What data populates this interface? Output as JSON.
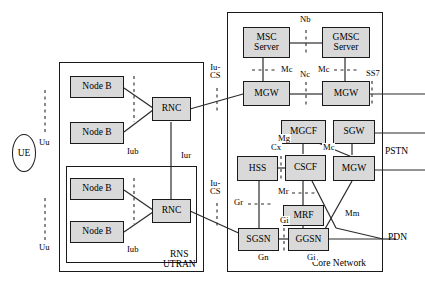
{
  "diagram": {
    "groups": [
      {
        "key": "utran",
        "label": "UTRAN"
      },
      {
        "key": "rns",
        "label": "RNS"
      },
      {
        "key": "core",
        "label": "Core Network"
      }
    ],
    "terminal": {
      "label": "UE"
    },
    "nodes": [
      {
        "key": "nodeb1",
        "label": "Node B"
      },
      {
        "key": "nodeb2",
        "label": "Node B"
      },
      {
        "key": "nodeb3",
        "label": "Node B"
      },
      {
        "key": "nodeb4",
        "label": "Node B"
      },
      {
        "key": "rnc1",
        "label": "RNC"
      },
      {
        "key": "rnc2",
        "label": "RNC"
      },
      {
        "key": "msc_server",
        "label": "MSC\nServer"
      },
      {
        "key": "gmsc_server",
        "label": "GMSC\nServer"
      },
      {
        "key": "mgw1",
        "label": "MGW"
      },
      {
        "key": "mgw2",
        "label": "MGW"
      },
      {
        "key": "mgcf",
        "label": "MGCF"
      },
      {
        "key": "sgw",
        "label": "SGW"
      },
      {
        "key": "hss",
        "label": "HSS"
      },
      {
        "key": "cscf",
        "label": "CSCF"
      },
      {
        "key": "mgw3",
        "label": "MGW"
      },
      {
        "key": "mrf",
        "label": "MRF"
      },
      {
        "key": "sgsn",
        "label": "SGSN"
      },
      {
        "key": "ggsn",
        "label": "GGSN"
      }
    ],
    "interfaces": [
      {
        "key": "uu_top",
        "label": "Uu"
      },
      {
        "key": "uu_bottom",
        "label": "Uu"
      },
      {
        "key": "iub_top",
        "label": "Iub"
      },
      {
        "key": "iub_bottom",
        "label": "Iub"
      },
      {
        "key": "iur",
        "label": "Iur"
      },
      {
        "key": "iucs_top",
        "label": "Iu-\nCS"
      },
      {
        "key": "iucs_bot",
        "label": "Iu-\nCS"
      },
      {
        "key": "nb",
        "label": "Nb"
      },
      {
        "key": "mc_left",
        "label": "Mc"
      },
      {
        "key": "mc_right",
        "label": "Mc"
      },
      {
        "key": "nc",
        "label": "Nc"
      },
      {
        "key": "ss7",
        "label": "SS7"
      },
      {
        "key": "mg",
        "label": "Mg"
      },
      {
        "key": "mc_mgcf",
        "label": "Mc"
      },
      {
        "key": "cx",
        "label": "Cx"
      },
      {
        "key": "mr",
        "label": "Mr"
      },
      {
        "key": "gr",
        "label": "Gr"
      },
      {
        "key": "gi_mrf",
        "label": "Gi"
      },
      {
        "key": "gn",
        "label": "Gn"
      },
      {
        "key": "gi_ggsn",
        "label": "Gi"
      },
      {
        "key": "mm",
        "label": "Mm"
      }
    ],
    "external": [
      {
        "key": "pstn",
        "label": "PSTN"
      },
      {
        "key": "pdn",
        "label": "PDN"
      }
    ]
  }
}
